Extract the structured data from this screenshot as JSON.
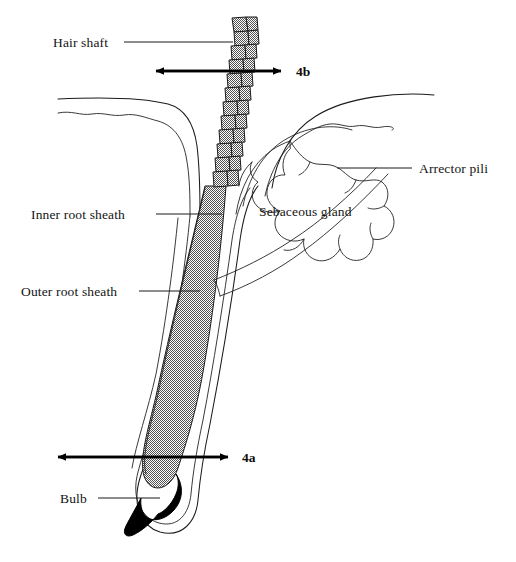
{
  "figure": {
    "background_color": "#ffffff",
    "ink_color": "#1b1b1b",
    "stipple_color": "#a8a8a8",
    "bulb_color": "#000000",
    "width": 516,
    "height": 562
  },
  "labels": {
    "hair_shaft": "Hair shaft",
    "inner_root_sheath": "Inner root sheath",
    "outer_root_sheath": "Outer root sheath",
    "sebaceous_gland": "Sebaceous gland",
    "arrector_pili": "Arrector pili",
    "bulb": "Bulb"
  },
  "section_markers": {
    "upper": "4b",
    "lower": "4a"
  },
  "structures": [
    {
      "name": "hair-shaft",
      "label": "Hair shaft",
      "description": "Keratinized scale-patterned shaft emerging above the skin surface"
    },
    {
      "name": "inner-root-sheath",
      "label": "Inner root sheath",
      "description": "Shaded layer immediately surrounding the hair within the follicle"
    },
    {
      "name": "outer-root-sheath",
      "label": "Outer root sheath",
      "description": "Outer epithelial layer of the follicle wall"
    },
    {
      "name": "sebaceous-gland",
      "label": "Sebaceous gland",
      "description": "Lobulated gland opening into the follicle"
    },
    {
      "name": "arrector-pili",
      "label": "Arrector pili",
      "description": "Smooth muscle band running from follicle to epidermis"
    },
    {
      "name": "bulb",
      "label": "Bulb",
      "description": "Solid dark hair bulb at the base of the follicle"
    },
    {
      "name": "skin-surface",
      "label": "",
      "description": "Epidermal surface lines at the top of the diagram"
    }
  ]
}
